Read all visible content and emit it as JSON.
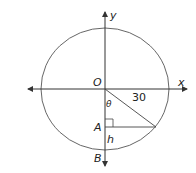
{
  "diagram": {
    "type": "circle-with-axes",
    "axes": {
      "x_label": "x",
      "y_label": "y"
    },
    "points": {
      "origin": "O",
      "A": "A",
      "B": "B"
    },
    "labels": {
      "radius_value": "30",
      "angle": "θ",
      "height": "h"
    },
    "colors": {
      "stroke": "#333333",
      "text": "#222222"
    }
  }
}
